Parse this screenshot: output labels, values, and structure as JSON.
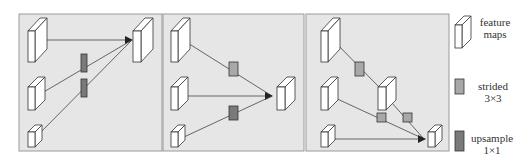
{
  "colors": {
    "panel_bg": "#e6e6e6",
    "panel_border": "#9a9a9a",
    "feature_map_fill": "#ffffff",
    "feature_map_stroke": "#333333",
    "strided_fill": "#a8a8a8",
    "upsample_fill": "#7a7a7a",
    "arrow": "#444444"
  },
  "panels": [
    {
      "id": "panel-a",
      "description": "top-down fusion: all levels upsampled into top feature map"
    },
    {
      "id": "panel-b",
      "description": "middle fusion: top strided down, bottom upsampled into middle"
    },
    {
      "id": "panel-c",
      "description": "bottom-up cascade via strided convolutions into bottom feature map"
    }
  ],
  "legend": {
    "feature_maps": {
      "line1": "feature",
      "line2": "maps"
    },
    "strided": {
      "line1": "strided",
      "line2": "3×3"
    },
    "upsample": {
      "line1": "upsample",
      "line2": "1×1"
    }
  }
}
